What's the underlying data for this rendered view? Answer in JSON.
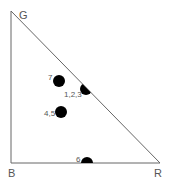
{
  "diagram": {
    "type": "color-triangle",
    "vertices": [
      {
        "label": "G",
        "x": 11,
        "y": 11,
        "lx": 19,
        "ly": 19
      },
      {
        "label": "B",
        "x": 11,
        "y": 163,
        "lx": 8,
        "ly": 177
      },
      {
        "label": "R",
        "x": 160,
        "y": 163,
        "lx": 154,
        "ly": 177
      }
    ],
    "points": [
      {
        "label": "7",
        "x": 59,
        "y": 81,
        "lx": 48,
        "ly": 80,
        "clip": "none"
      },
      {
        "label": "1,2,3",
        "x": 86,
        "y": 89,
        "lx": 64,
        "ly": 97,
        "clip": "hypotenuse"
      },
      {
        "label": "4,5",
        "x": 61,
        "y": 112,
        "lx": 44,
        "ly": 116,
        "clip": "none"
      },
      {
        "label": "6",
        "x": 87,
        "y": 163,
        "lx": 76,
        "ly": 162,
        "clip": "base"
      }
    ],
    "colors": {
      "line": "#666666",
      "dot": "#000000",
      "label": "#555555"
    }
  }
}
